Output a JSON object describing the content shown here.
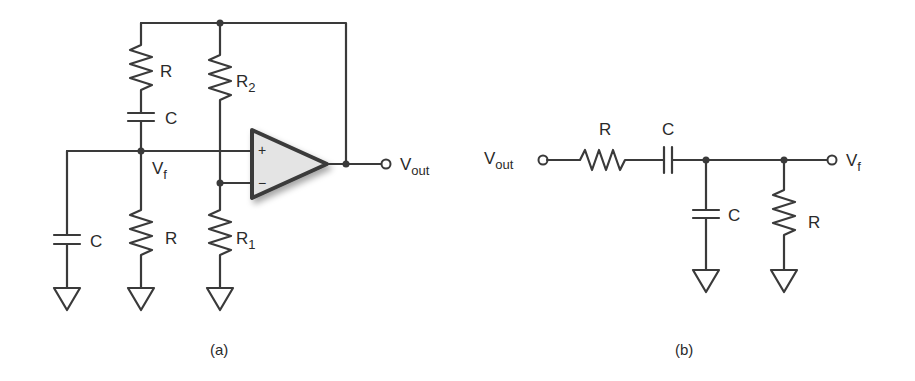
{
  "figure": {
    "a": {
      "caption": "(a)",
      "labels": {
        "r_series": "R",
        "c_series": "C",
        "r2": "R",
        "r2_sub": "2",
        "r1": "R",
        "r1_sub": "1",
        "c_shunt": "C",
        "r_shunt": "R",
        "vf": "V",
        "vf_sub": "f",
        "vout": "V",
        "vout_sub": "out",
        "plus": "+",
        "minus": "−"
      }
    },
    "b": {
      "caption": "(b)",
      "labels": {
        "vout": "V",
        "vout_sub": "out",
        "r_series": "R",
        "c_series": "C",
        "c_shunt": "C",
        "r_shunt": "R",
        "vf": "V",
        "vf_sub": "f"
      }
    }
  }
}
